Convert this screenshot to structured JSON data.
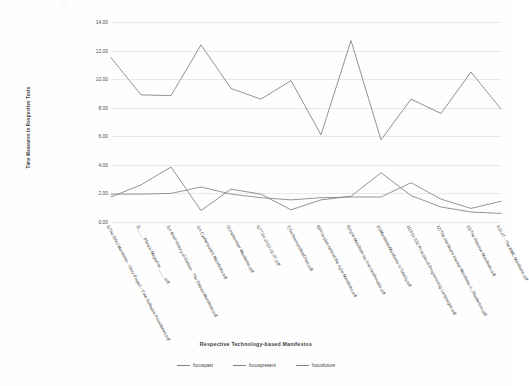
{
  "chart_data": {
    "type": "line",
    "title": "",
    "subtitle": "",
    "xlabel": "Respective Technology-based  Manifestos",
    "ylabel": "Time Measures in Respective Texts",
    "ylim": [
      0.0,
      14.0
    ],
    "ytick_labels": [
      "0.00",
      "2.00",
      "4.00",
      "6.00",
      "8.00",
      "10.00",
      "12.00",
      "14.00"
    ],
    "ytick_values": [
      0,
      2,
      4,
      6,
      8,
      10,
      12,
      14
    ],
    "grid": true,
    "legend_position": "bottom",
    "categories": [
      "1)The GNU Manifesto - GNU Project - Free Software Foundation.pdf",
      "2)____ Phrack Magazine ____.pdf",
      "3)A Brief History of Debian - The Debian Manifesto.pdf",
      "4)A Cypherpunk's Manifesto.pdf",
      "5)Unabomber Manifesto.pdf",
      "6)TTSA-2013-02-07.pdf",
      "7)TechnomanifestOnes.pdf",
      "8)Principles behind the Agile Manifesto.pdf",
      "9)Agile Manifesto by Ana Inoshmadai.pdf",
      "10)ManifestoManifesto in Totality.pdf",
      "11)S15-332 Principle of Programming Languages.pdf",
      "12)The Hardware Hacker Manifesto A_Shaderson.pdf",
      "13)The Resolve Manifesto.pdf",
      "14)Lo7 - The BMC Manifesto.pdf"
    ],
    "series": [
      {
        "name": "focuspast",
        "color": "#7f7f7f",
        "values": [
          1.75,
          2.6,
          3.85,
          0.8,
          2.3,
          1.95,
          0.85,
          1.55,
          1.8,
          3.45,
          1.85,
          1.05,
          0.7,
          0.6
        ]
      },
      {
        "name": "focuspresent",
        "color": "#808080",
        "values": [
          11.5,
          8.9,
          8.85,
          12.4,
          9.35,
          8.6,
          9.9,
          6.1,
          12.7,
          5.75,
          8.6,
          7.6,
          10.5,
          7.9
        ]
      },
      {
        "name": "focusfuture",
        "color": "#848484",
        "values": [
          1.95,
          1.95,
          2.0,
          2.45,
          1.95,
          1.7,
          1.55,
          1.7,
          1.75,
          1.75,
          2.75,
          1.6,
          0.95,
          1.45
        ]
      }
    ],
    "legend_entries": [
      {
        "label": "focuspast"
      },
      {
        "label": "focuspresent"
      },
      {
        "label": "focusfuture"
      }
    ]
  },
  "colors": {
    "background": "#ffffff",
    "gridline": "#e9e9e9",
    "line": "#7f7f7f",
    "text": "#3f3f3f"
  }
}
